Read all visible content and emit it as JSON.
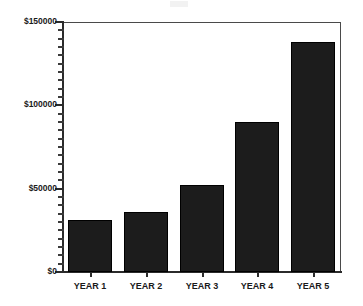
{
  "chart_data": {
    "type": "bar",
    "title": "",
    "subtitle": "",
    "xlabel": "",
    "ylabel": "",
    "categories": [
      "YEAR 1",
      "YEAR 2",
      "YEAR 3",
      "YEAR 4",
      "YEAR 5"
    ],
    "values": [
      31000,
      36000,
      52500,
      90000,
      138000
    ],
    "series": [
      {
        "name": "",
        "values": [
          31000,
          36000,
          52500,
          90000,
          138000
        ]
      }
    ],
    "ylim": [
      0,
      150000
    ],
    "ytick_labels": [
      "$0",
      "$50000",
      "$100000",
      "$150000"
    ],
    "ytick_values": [
      0,
      50000,
      100000,
      150000
    ],
    "grid": false,
    "legend": false,
    "legend_position": "none",
    "bar_color": "#1c1c1c",
    "axis_color": "#2b2b2b",
    "background_color": "#ffffff",
    "minor_ticks": true,
    "annotations": []
  },
  "axis": {
    "y_labels": [
      {
        "text": "$150000",
        "value": 150000
      },
      {
        "text": "$100000",
        "value": 100000
      },
      {
        "text": "$50000",
        "value": 50000
      },
      {
        "text": "$0",
        "value": 0
      }
    ],
    "x_labels": [
      "YEAR 1",
      "YEAR 2",
      "YEAR 3",
      "YEAR 4",
      "YEAR 5"
    ]
  },
  "ghost": {
    "text": ""
  }
}
